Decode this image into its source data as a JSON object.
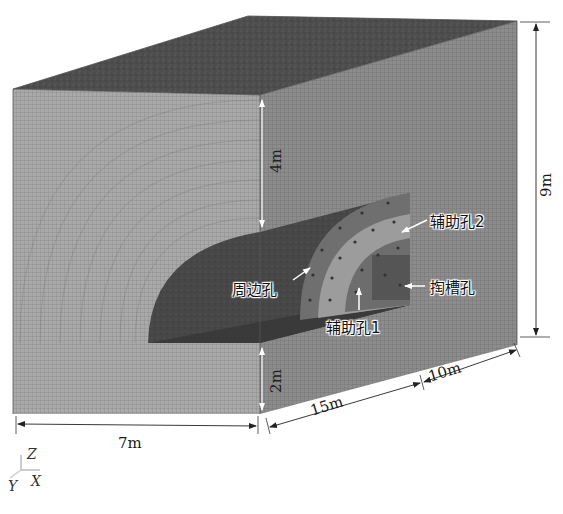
{
  "figure": {
    "type": "3d-mesh-model"
  },
  "dimensions": {
    "top_to_tunnel": "4m",
    "tunnel_to_bottom": "2m",
    "height_total": "9m",
    "width": "7m",
    "length_front": "15m",
    "length_back": "10m"
  },
  "labels": {
    "perimeter_holes": "周边孔",
    "auxiliary_holes_2": "辅助孔2",
    "cut_holes": "掏槽孔",
    "auxiliary_holes_1": "辅助孔1"
  },
  "axes": {
    "z": "Z",
    "x": "X",
    "y": "Y"
  },
  "colors": {
    "mesh_light": "#a8a8a8",
    "mesh_mid": "#8a8a8a",
    "top_dark": "#4a4a4a",
    "tunnel_dark": "#3a3a3a",
    "ring_light": "#9e9e9e",
    "ring_mid": "#7a7a7a"
  }
}
